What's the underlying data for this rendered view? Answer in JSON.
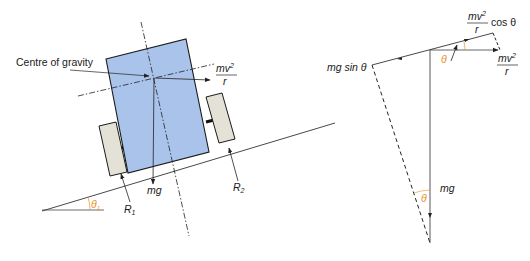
{
  "diagram": {
    "left_panel": {
      "labels": {
        "centre_of_gravity": "Centre of gravity",
        "centripetal_num": "mv",
        "centripetal_exp": "2",
        "centripetal_den": "r",
        "weight": "mg",
        "reaction_1": "R",
        "reaction_1_sub": "1",
        "reaction_2": "R",
        "reaction_2_sub": "2",
        "bank_angle": "θ",
        "bank_angle_sub": "1"
      }
    },
    "right_panel": {
      "labels": {
        "cos_num": "mv",
        "cos_exp": "2",
        "cos_den": "r",
        "cos_suffix": "cos θ",
        "horizontal_num": "mv",
        "horizontal_exp": "2",
        "horizontal_den": "r",
        "mg_sin": "mg sin θ",
        "weight": "mg",
        "angle_top": "θ",
        "angle_bottom": "θ"
      }
    },
    "colors": {
      "body_fill": "#a9c3ea",
      "body_stroke": "#1a1a1a",
      "wheel_fill": "#e4e2d6",
      "line": "#333333",
      "angle": "#e8902a"
    }
  }
}
